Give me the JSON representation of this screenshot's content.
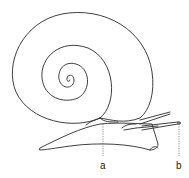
{
  "figure": {
    "stroke_color": "#2a2a2a",
    "background": "#ffffff",
    "labels": [
      {
        "id": "a",
        "text": "a",
        "x": 100,
        "y": 161
      },
      {
        "id": "b",
        "text": "b",
        "x": 176,
        "y": 161
      }
    ]
  }
}
